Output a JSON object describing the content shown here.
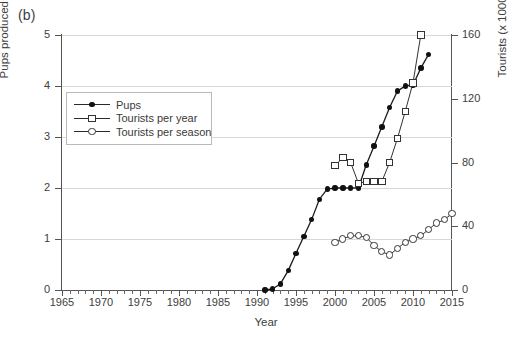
{
  "panel": {
    "label": "(b)"
  },
  "axes": {
    "x": {
      "label": "Year",
      "min": 1965,
      "max": 2015,
      "ticks": [
        1965,
        1970,
        1975,
        1980,
        1985,
        1990,
        1995,
        2000,
        2005,
        2010,
        2015
      ],
      "minor_step": 1
    },
    "y_left": {
      "label": "Pups produced (x 1000)",
      "min": 0,
      "max": 5,
      "ticks": [
        0,
        1,
        2,
        3,
        4,
        5
      ]
    },
    "y_right": {
      "label": "Tourists (x 1000)",
      "min": 0,
      "max": 160,
      "ticks": [
        0,
        40,
        80,
        120,
        160
      ]
    }
  },
  "legend": {
    "position": "upper-left-inside",
    "items": [
      {
        "label": "Pups",
        "marker": "filled-circle",
        "axis": "left"
      },
      {
        "label": "Tourists per year",
        "marker": "open-square",
        "axis": "right"
      },
      {
        "label": "Tourists per season",
        "marker": "open-circle",
        "axis": "right"
      }
    ]
  },
  "chart_data": {
    "type": "line",
    "title": "",
    "xlabel": "Year",
    "ylabel": "Pups produced (x 1000)",
    "ylabel_secondary": "Tourists (x 1000)",
    "xlim": [
      1965,
      2015
    ],
    "ylim": [
      0,
      5
    ],
    "ylim_secondary": [
      0,
      160
    ],
    "grid": "horizontal",
    "series": [
      {
        "name": "Pups",
        "axis": "left",
        "marker": "filled-circle",
        "x": [
          1991,
          1992,
          1993,
          1994,
          1995,
          1996,
          1997,
          1998,
          1999,
          2000,
          2001,
          2002,
          2003,
          2004,
          2005,
          2006,
          2007,
          2008,
          2009,
          2010,
          2011,
          2012
        ],
        "values": [
          0.0,
          0.02,
          0.12,
          0.38,
          0.72,
          1.05,
          1.38,
          1.78,
          1.98,
          2.0,
          2.0,
          2.0,
          2.0,
          2.45,
          2.82,
          3.2,
          3.58,
          3.9,
          4.0,
          4.02,
          4.35,
          4.62
        ]
      },
      {
        "name": "Tourists per year",
        "axis": "right",
        "marker": "open-square",
        "x": [
          2000,
          2001,
          2002,
          2003,
          2004,
          2005,
          2006,
          2007,
          2008,
          2009,
          2010,
          2011
        ],
        "values": [
          78,
          83,
          80,
          67,
          68,
          68,
          68,
          80,
          95,
          112,
          130,
          160
        ]
      },
      {
        "name": "Tourists per season",
        "axis": "right",
        "marker": "open-circle",
        "x": [
          2000,
          2001,
          2002,
          2003,
          2004,
          2005,
          2006,
          2007,
          2008,
          2009,
          2010,
          2011,
          2012,
          2013,
          2014,
          2015
        ],
        "values": [
          30,
          32,
          34,
          34,
          33,
          28,
          24,
          22,
          26,
          30,
          32,
          34,
          38,
          42,
          44,
          48
        ]
      }
    ]
  }
}
